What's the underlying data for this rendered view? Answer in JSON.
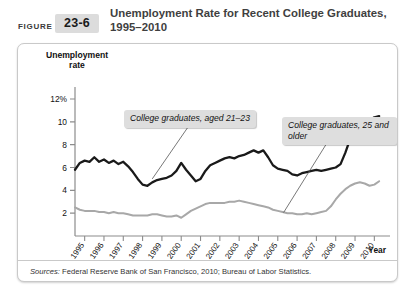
{
  "header": {
    "figure_word": "FIGURE",
    "figure_number": "23-6",
    "title": "Unemployment Rate for Recent College Graduates, 1995–2010"
  },
  "footer": {
    "sources_label": "Sources:",
    "sources_text": " Federal Reserve Bank of San Francisco, 2010; Bureau of Labor Statistics."
  },
  "colors": {
    "series_young": "#1a1a1a",
    "series_older": "#a8a8a8",
    "callout_bg": "#dedede",
    "figure_badge_bg": "#dcdcdc",
    "axis": "#8c8c8c",
    "box_border": "#c9c9c9"
  },
  "chart_data": {
    "type": "line",
    "title": "Unemployment Rate for Recent College Graduates, 1995–2010",
    "xlabel": "Year",
    "ylabel": "Unemployment rate",
    "ylim": [
      0,
      12
    ],
    "yticks": [
      2,
      4,
      6,
      8,
      10,
      12
    ],
    "ytick_labels": [
      "2",
      "4",
      "6",
      "8",
      "10",
      "12%"
    ],
    "xlim": [
      1995,
      2011
    ],
    "xticks": [
      1995,
      1996,
      1997,
      1998,
      1999,
      2000,
      2001,
      2002,
      2003,
      2004,
      2005,
      2006,
      2007,
      2008,
      2009,
      2010
    ],
    "xtick_labels": [
      "1995",
      "1996",
      "1997",
      "1998",
      "1999",
      "2000",
      "2001",
      "2002",
      "2003",
      "2004",
      "2005",
      "2006",
      "2007",
      "2008",
      "2009",
      "2010"
    ],
    "grid": false,
    "legend_position": "annotations",
    "annotations": [
      {
        "text": "College graduates, aged 21–23",
        "series": "College graduates, aged 21-23",
        "pointer_x": 1999.0,
        "pointer_y": 5.0
      },
      {
        "text": "College graduates, 25 and older",
        "series": "College graduates, 25 and older",
        "pointer_x": 2005.8,
        "pointer_y": 2.05
      }
    ],
    "series": [
      {
        "name": "College graduates, aged 21-23",
        "color": "#1a1a1a",
        "x": [
          1995.0,
          1995.25,
          1995.5,
          1995.75,
          1996.0,
          1996.25,
          1996.5,
          1996.75,
          1997.0,
          1997.25,
          1997.5,
          1997.75,
          1998.0,
          1998.25,
          1998.5,
          1998.75,
          1999.0,
          1999.25,
          1999.5,
          1999.75,
          2000.0,
          2000.25,
          2000.5,
          2000.75,
          2001.0,
          2001.25,
          2001.5,
          2001.75,
          2002.0,
          2002.25,
          2002.5,
          2002.75,
          2003.0,
          2003.25,
          2003.5,
          2003.75,
          2004.0,
          2004.25,
          2004.5,
          2004.75,
          2005.0,
          2005.25,
          2005.5,
          2005.75,
          2006.0,
          2006.25,
          2006.5,
          2006.75,
          2007.0,
          2007.25,
          2007.5,
          2007.75,
          2008.0,
          2008.25,
          2008.5,
          2008.75,
          2009.0,
          2009.25,
          2009.5,
          2009.75,
          2010.0,
          2010.25,
          2010.5,
          2010.75
        ],
        "y": [
          5.8,
          6.4,
          6.6,
          6.5,
          6.9,
          6.5,
          6.7,
          6.4,
          6.6,
          6.3,
          6.5,
          6.1,
          5.6,
          5.0,
          4.5,
          4.4,
          4.7,
          4.9,
          5.0,
          5.1,
          5.3,
          5.7,
          6.4,
          5.8,
          5.3,
          4.8,
          5.0,
          5.7,
          6.2,
          6.4,
          6.6,
          6.8,
          6.9,
          6.8,
          7.0,
          7.1,
          7.3,
          7.5,
          7.3,
          7.5,
          6.9,
          6.2,
          5.9,
          5.8,
          5.7,
          5.4,
          5.3,
          5.5,
          5.6,
          5.7,
          5.8,
          5.7,
          5.8,
          5.9,
          6.0,
          6.3,
          7.3,
          8.5,
          9.4,
          9.9,
          10.2,
          10.1,
          10.4,
          10.5
        ],
        "approx_start": 5.8,
        "approx_end": 10.5,
        "min": 4.4,
        "max": 10.5
      },
      {
        "name": "College graduates, 25 and older",
        "color": "#a8a8a8",
        "x": [
          1995.0,
          1995.25,
          1995.5,
          1995.75,
          1996.0,
          1996.25,
          1996.5,
          1996.75,
          1997.0,
          1997.25,
          1997.5,
          1997.75,
          1998.0,
          1998.25,
          1998.5,
          1998.75,
          1999.0,
          1999.25,
          1999.5,
          1999.75,
          2000.0,
          2000.25,
          2000.5,
          2000.75,
          2001.0,
          2001.25,
          2001.5,
          2001.75,
          2002.0,
          2002.25,
          2002.5,
          2002.75,
          2003.0,
          2003.25,
          2003.5,
          2003.75,
          2004.0,
          2004.25,
          2004.5,
          2004.75,
          2005.0,
          2005.25,
          2005.5,
          2005.75,
          2006.0,
          2006.25,
          2006.5,
          2006.75,
          2007.0,
          2007.25,
          2007.5,
          2007.75,
          2008.0,
          2008.25,
          2008.5,
          2008.75,
          2009.0,
          2009.25,
          2009.5,
          2009.75,
          2010.0,
          2010.25,
          2010.5,
          2010.75
        ],
        "y": [
          2.5,
          2.3,
          2.2,
          2.2,
          2.2,
          2.1,
          2.1,
          2.0,
          2.1,
          2.0,
          2.0,
          1.9,
          1.8,
          1.8,
          1.8,
          1.8,
          1.9,
          1.9,
          1.8,
          1.7,
          1.7,
          1.8,
          1.6,
          1.9,
          2.2,
          2.4,
          2.6,
          2.8,
          2.9,
          2.9,
          2.9,
          2.9,
          3.0,
          3.0,
          3.1,
          3.0,
          2.9,
          2.8,
          2.7,
          2.6,
          2.5,
          2.3,
          2.2,
          2.1,
          2.0,
          2.0,
          1.9,
          1.9,
          2.0,
          1.9,
          2.0,
          2.1,
          2.2,
          2.6,
          3.2,
          3.7,
          4.1,
          4.4,
          4.6,
          4.7,
          4.6,
          4.4,
          4.5,
          4.8
        ],
        "approx_start": 2.5,
        "approx_end": 4.8,
        "min": 1.6,
        "max": 4.8
      }
    ]
  }
}
